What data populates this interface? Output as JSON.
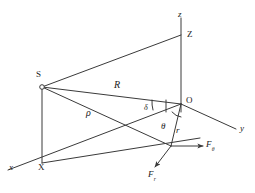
{
  "figure": {
    "kind": "geometry-diagram",
    "line_color": "#3a3a3a",
    "text_color": "#1a1a1a",
    "background": "#ffffff"
  },
  "axes": [
    {
      "id": "z",
      "label": "z",
      "label_style": "italic",
      "x": 178,
      "y": 10
    },
    {
      "id": "y",
      "label": "y",
      "label_style": "italic",
      "x": 240,
      "y": 124
    },
    {
      "id": "x",
      "label": "x",
      "label_style": "italic",
      "x": 9,
      "y": 163
    }
  ],
  "points": [
    {
      "id": "Z",
      "label": "Z",
      "label_style": "roman",
      "x": 187,
      "y": 30
    },
    {
      "id": "S",
      "label": "S",
      "label_style": "roman",
      "x": 36,
      "y": 70
    },
    {
      "id": "O",
      "label": "O",
      "label_style": "roman",
      "x": 186,
      "y": 96
    },
    {
      "id": "X",
      "label": "X",
      "label_style": "roman",
      "x": 38,
      "y": 163
    }
  ],
  "segments": [
    {
      "id": "R",
      "label": "R",
      "label_style": "italic",
      "x": 114,
      "y": 80
    },
    {
      "id": "rho",
      "label": "ρ",
      "label_style": "italic",
      "x": 86,
      "y": 108
    },
    {
      "id": "r",
      "label": "r",
      "label_style": "italic",
      "x": 176,
      "y": 126
    }
  ],
  "angles": [
    {
      "id": "delta",
      "label": "δ",
      "label_style": "italic",
      "x": 144,
      "y": 104
    },
    {
      "id": "theta",
      "label": "θ",
      "label_style": "italic",
      "x": 161,
      "y": 122
    }
  ],
  "forces": [
    {
      "id": "F-theta",
      "base": "F",
      "subscript": "θ",
      "x": 206,
      "y": 141
    },
    {
      "id": "F-r",
      "base": "F",
      "subscript": "r",
      "x": 148,
      "y": 171
    }
  ]
}
